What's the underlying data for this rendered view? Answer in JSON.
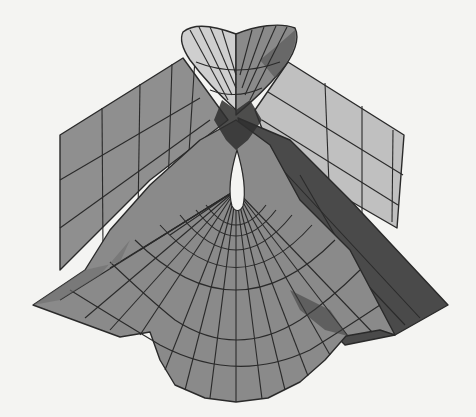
{
  "figure": {
    "background_color": "#f4f4f2",
    "colors": {
      "mid_gray": "#8e8e8e",
      "light_gray": "#b5b5b5",
      "lighter_gray": "#cfcfcf",
      "dark_gray": "#5a5a5a",
      "darkest_gray": "#3c3c3c",
      "hole": "#f4f4f2",
      "grid_line": "#2a2a2a"
    }
  }
}
